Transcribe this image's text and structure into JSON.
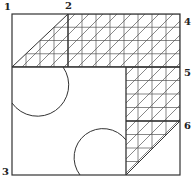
{
  "labels": [
    {
      "id": "1",
      "text": "1",
      "x": 4,
      "y": 2
    },
    {
      "id": "2",
      "text": "2",
      "x": 65,
      "y": 1
    },
    {
      "id": "3",
      "text": "3",
      "x": 2,
      "y": 167
    },
    {
      "id": "4",
      "text": "4",
      "x": 184,
      "y": 17
    },
    {
      "id": "5",
      "text": "5",
      "x": 184,
      "y": 68
    },
    {
      "id": "6",
      "text": "6",
      "x": 184,
      "y": 121
    }
  ],
  "geometry": {
    "outer": {
      "x1": 12,
      "y1": 14,
      "x2": 180,
      "y2": 175
    },
    "grid_step": 13.5,
    "divider_y": 67,
    "divider_x_top": 68,
    "column_x": 126,
    "mid_y": 121
  },
  "colors": {
    "line": "#333333",
    "hatch": "#555555",
    "background": "#ffffff"
  }
}
